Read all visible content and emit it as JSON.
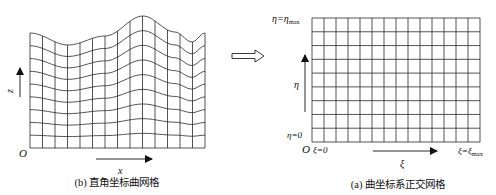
{
  "left_panel": {
    "caption": "(b) 直角坐标曲网格",
    "x_axis_label": "x",
    "z_axis_label": "z",
    "origin_label": "O",
    "grid": {
      "columns": 14,
      "rows": 9,
      "x_min": 30,
      "x_max": 205,
      "bottom": 148
    },
    "top_curve": [
      [
        30,
        33
      ],
      [
        68,
        45
      ],
      [
        105,
        36
      ],
      [
        143,
        16
      ],
      [
        175,
        32
      ],
      [
        192,
        42
      ],
      [
        205,
        33
      ]
    ]
  },
  "transform_arrow": {
    "label": ""
  },
  "right_panel": {
    "caption": "(a) 曲坐标系正交网格",
    "eta_top_label": "η=η",
    "eta_top_sub": "max",
    "eta_axis_label": "η",
    "eta_zero_label": "η=0",
    "origin_label": "O",
    "xi_zero_label": "ξ=0",
    "xi_axis_label": "ξ",
    "xi_max_label": "ξ=ξ",
    "xi_max_sub": "max",
    "grid": {
      "columns": 14,
      "rows": 9,
      "x_min": 312,
      "x_max": 480,
      "y_min": 18,
      "y_max": 142
    }
  },
  "colors": {
    "line": "#222222",
    "background": "#ffffff"
  }
}
